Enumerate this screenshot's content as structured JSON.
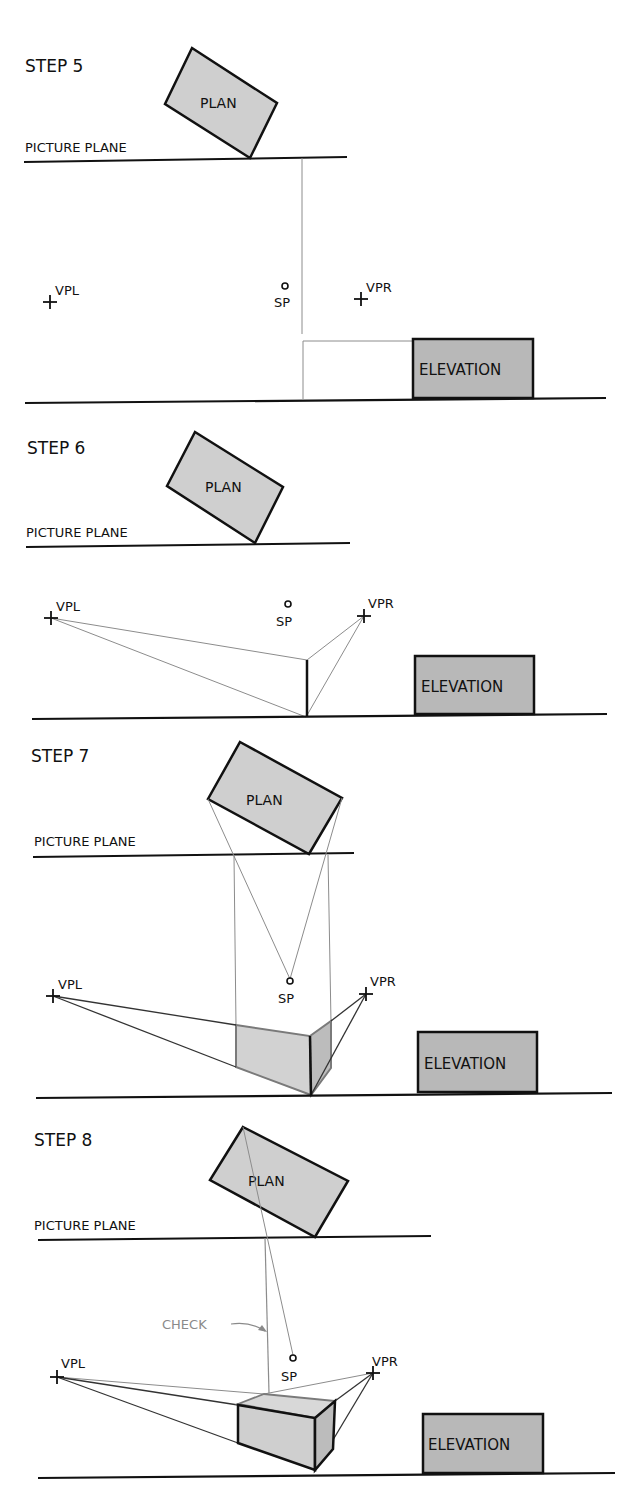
{
  "colors": {
    "ink": "#111111",
    "construction": "#8c8c8c",
    "plan_fill": "#cfcfcf",
    "elevation_fill": "#b8b8b8",
    "face_light": "#d6d6d6",
    "face_dark": "#bcbcbc",
    "check_label": "#8a8a8a"
  },
  "labels": {
    "picture_plane": "PICTURE PLANE",
    "plan": "PLAN",
    "elevation": "ELEVATION",
    "vpl": "VPL",
    "vpr": "VPR",
    "sp": "SP",
    "check": "CHECK"
  },
  "steps": [
    {
      "title": "STEP 5"
    },
    {
      "title": "STEP 6"
    },
    {
      "title": "STEP 7"
    },
    {
      "title": "STEP 8"
    }
  ]
}
